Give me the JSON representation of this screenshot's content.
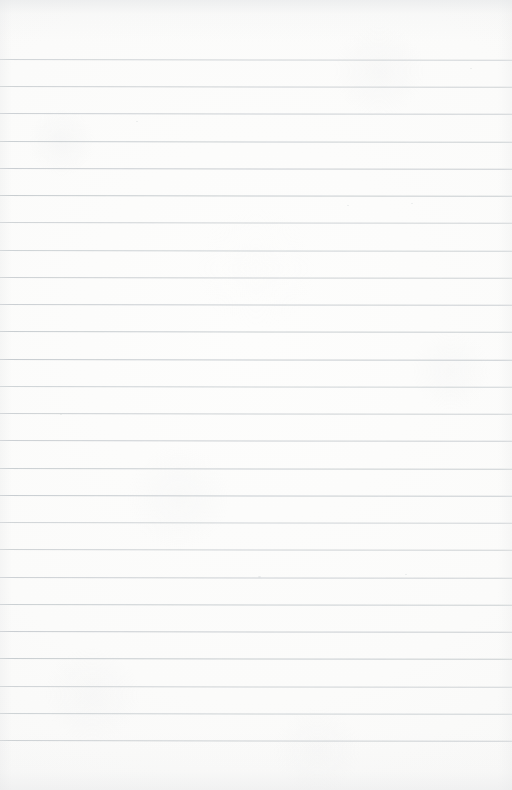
{
  "document": {
    "kind": "scanned-ruled-notepaper",
    "title": "Blank Ruled Notepaper",
    "orientation": "portrait",
    "width_px": 512,
    "height_px": 790,
    "has_text_content": false,
    "content_text": "",
    "page_number_text": ""
  },
  "colors": {
    "paper_background": "#fbfbfa",
    "paper_highlight": "#fdfdfc",
    "paper_shadow": "#f2f3f3",
    "rule_line": "#c5cace",
    "edge_shading": "#e2e4e6",
    "speck": "#d9dcde"
  },
  "ruling": {
    "line_count": 26,
    "first_line_y": 59,
    "line_spacing_px": 27.2,
    "line_thickness_px": 1,
    "line_left_x": 0,
    "line_right_x": 512,
    "skew_degrees": 0.09,
    "margin_top_px": 59,
    "margin_bottom_px": 44,
    "has_vertical_margin_rule": false,
    "line_y_positions": [
      59,
      86,
      113,
      141,
      168,
      195,
      222,
      250,
      277,
      304,
      331,
      359,
      386,
      413,
      440,
      468,
      495,
      522,
      549,
      577,
      604,
      631,
      658,
      686,
      713,
      740
    ]
  },
  "artifacts": {
    "specks": [
      {
        "x": 258,
        "y": 576,
        "size": 3
      },
      {
        "x": 405,
        "y": 574,
        "size": 2
      },
      {
        "x": 347,
        "y": 205,
        "size": 2
      },
      {
        "x": 411,
        "y": 203,
        "size": 2
      },
      {
        "x": 136,
        "y": 121,
        "size": 2
      },
      {
        "x": 60,
        "y": 414,
        "size": 2
      },
      {
        "x": 470,
        "y": 68,
        "size": 2
      }
    ]
  }
}
